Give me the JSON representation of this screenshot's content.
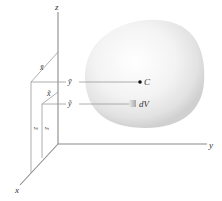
{
  "figure": {
    "type": "3d-centroid-diagram",
    "axes": {
      "x_label": "x",
      "y_label": "y",
      "z_label": "z"
    },
    "centroid": {
      "label": "C",
      "x_label": "x̄",
      "y_label": "ȳ",
      "z_label": "z̄"
    },
    "element": {
      "label": "dV",
      "x_label": "x̃",
      "y_label": "ỹ",
      "z_label": "z̃"
    },
    "colors": {
      "axis": "#8a8a8a",
      "body_light": "#f6f6f6",
      "body_shadow": "#d4d4d4",
      "dot": "#111111",
      "element": "#bdbdbd"
    }
  }
}
